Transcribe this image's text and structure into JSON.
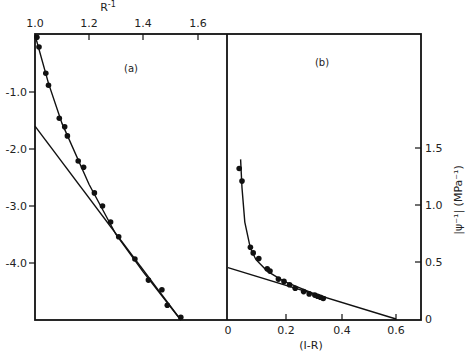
{
  "chart_data": [
    {
      "panel": "(a)",
      "type": "scatter",
      "title": "",
      "xlabel": "R^-1",
      "ylabel": "",
      "xlim": [
        1.0,
        1.7
      ],
      "ylim": [
        -5.0,
        0.0
      ],
      "x_ticks": [
        "1.0",
        "1.2",
        "1.4",
        "1.6"
      ],
      "y_ticks": [
        "-1.0",
        "-2.0",
        "-3.0",
        "-4.0"
      ],
      "x_axis_position": "top",
      "grid": false,
      "series": [
        {
          "name": "measured points",
          "x": [
            1.007,
            1.015,
            1.04,
            1.05,
            1.09,
            1.11,
            1.12,
            1.16,
            1.18,
            1.22,
            1.25,
            1.28,
            1.31,
            1.37,
            1.42,
            1.47,
            1.49,
            1.54
          ],
          "y": [
            -0.04,
            -0.21,
            -0.67,
            -0.88,
            -1.46,
            -1.61,
            -1.77,
            -2.21,
            -2.32,
            -2.77,
            -3.0,
            -3.28,
            -3.54,
            -3.93,
            -4.3,
            -4.47,
            -4.74,
            -4.95
          ]
        },
        {
          "name": "fitted curve",
          "x": [
            1.0,
            1.05,
            1.1,
            1.2,
            1.3,
            1.4,
            1.54
          ],
          "y": [
            0.0,
            -0.85,
            -1.55,
            -2.62,
            -3.5,
            -4.15,
            -5.0
          ]
        },
        {
          "name": "linear extrapolation",
          "x": [
            1.0,
            1.54
          ],
          "y": [
            -1.6,
            -5.0
          ]
        }
      ]
    },
    {
      "panel": "(b)",
      "type": "scatter",
      "title": "",
      "xlabel": "(1-R)",
      "ylabel": "|ψ^-1| (MPa^-1)",
      "xlim": [
        0.0,
        0.68
      ],
      "ylim": [
        0.0,
        1.75
      ],
      "x_ticks": [
        "0",
        "0.2",
        "0.4",
        "0.6"
      ],
      "y_ticks": [
        "0",
        "0.5",
        "1.0",
        "1.5"
      ],
      "y_axis_position": "right",
      "grid": false,
      "series": [
        {
          "name": "measured points",
          "x": [
            0.04,
            0.05,
            0.08,
            0.09,
            0.11,
            0.14,
            0.15,
            0.18,
            0.2,
            0.22,
            0.24,
            0.27,
            0.29,
            0.31,
            0.32,
            0.33,
            0.34
          ],
          "y": [
            1.32,
            1.21,
            0.63,
            0.58,
            0.53,
            0.44,
            0.42,
            0.35,
            0.33,
            0.3,
            0.27,
            0.24,
            0.22,
            0.21,
            0.2,
            0.19,
            0.18
          ]
        },
        {
          "name": "fitted curve",
          "x": [
            0.045,
            0.05,
            0.06,
            0.08,
            0.1,
            0.14,
            0.2,
            0.3,
            0.35
          ],
          "y": [
            1.4,
            1.15,
            0.85,
            0.62,
            0.52,
            0.42,
            0.33,
            0.23,
            0.19
          ]
        },
        {
          "name": "linear extrapolation",
          "x": [
            0.0,
            0.6
          ],
          "y": [
            0.45,
            0.0
          ]
        }
      ]
    }
  ],
  "labels": {
    "panel_a": "(a)",
    "panel_b": "(b)",
    "top_xlabel": "R",
    "top_xlabel_sup": "-1",
    "bottom_xlabel": "(I-R)",
    "right_ylabel": "|ψ⁻¹| (MPa⁻¹)",
    "a_xticks": [
      "1.0",
      "1.2",
      "1.4",
      "1.6"
    ],
    "a_yticks": [
      "-1.0",
      "-2.0",
      "-3.0",
      "-4.0"
    ],
    "b_xticks": [
      "0",
      "0.2",
      "0.4",
      "0.6"
    ],
    "b_yticks": [
      "0",
      "0.5",
      "1.0",
      "1.5"
    ]
  }
}
